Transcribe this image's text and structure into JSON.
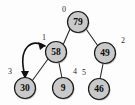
{
  "diagram": {
    "type": "binary-heap-tree",
    "title": "",
    "colors": {
      "node_fill": "#c9c9c9",
      "node_stroke": "#1a1a1a",
      "edge": "#2b2b2b",
      "arrow": "#111111",
      "background": "#fdfdfd",
      "value_text": "#0c0c0c",
      "index_text": "#2a2a2a"
    },
    "nodes": [
      {
        "index_label": "0",
        "value": "79",
        "cx": 78,
        "cy": 22,
        "r": 10.5,
        "label_x": 64,
        "label_y": 9
      },
      {
        "index_label": "1",
        "value": "58",
        "cx": 56,
        "cy": 52,
        "r": 10.5,
        "label_x": 44,
        "label_y": 37
      },
      {
        "index_label": "2",
        "value": "49",
        "cx": 105,
        "cy": 53,
        "r": 10.5,
        "label_x": 123,
        "label_y": 40
      },
      {
        "index_label": "3",
        "value": "30",
        "cx": 25,
        "cy": 88,
        "r": 10.5,
        "label_x": 10,
        "label_y": 71
      },
      {
        "index_label": "4",
        "value": "9",
        "cx": 63,
        "cy": 88,
        "r": 10.5,
        "label_x": 75,
        "label_y": 71
      },
      {
        "index_label": "5",
        "value": "46",
        "cx": 99,
        "cy": 89,
        "r": 10.5,
        "label_x": 84,
        "label_y": 72
      }
    ],
    "edges": [
      {
        "from": "79",
        "to": "58",
        "x1": 70,
        "y1": 29,
        "x2": 63,
        "y2": 45
      },
      {
        "from": "79",
        "to": "49",
        "x1": 86,
        "y1": 29,
        "x2": 98,
        "y2": 46
      },
      {
        "from": "58",
        "to": "30",
        "x1": 48,
        "y1": 59,
        "x2": 32,
        "y2": 81
      },
      {
        "from": "58",
        "to": "9",
        "x1": 59,
        "y1": 63,
        "x2": 62,
        "y2": 78
      },
      {
        "from": "49",
        "to": "46",
        "x1": 103,
        "y1": 64,
        "x2": 100,
        "y2": 79
      }
    ],
    "annotation": {
      "kind": "swap-arrow",
      "description": "curved double-headed arrow between node 3 and node 1",
      "from_index_label": "3",
      "to_index_label": "1",
      "path": "M 25 76 C 17 46, 33 38, 45 46",
      "head_up": {
        "points": "45,46 38,42 40,50"
      },
      "head_down": {
        "points": "25,79 21,71 29,71"
      }
    }
  }
}
